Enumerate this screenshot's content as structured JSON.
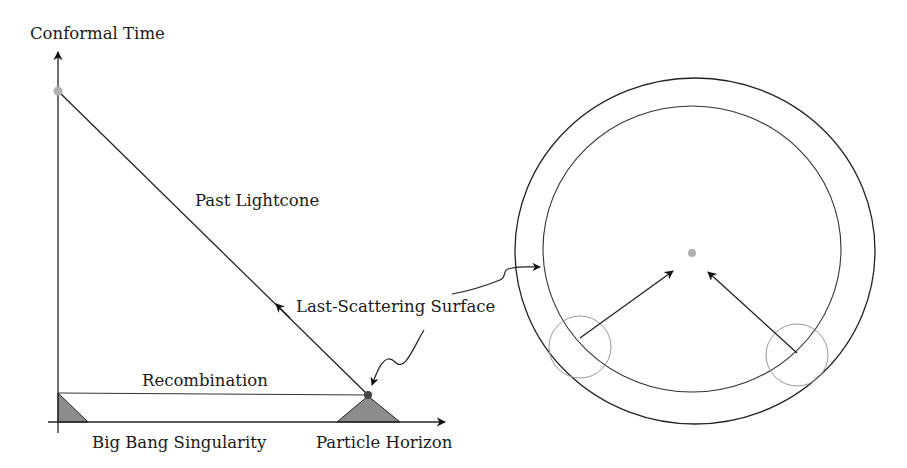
{
  "diagram": {
    "axes": {
      "y_label": "Conformal Time",
      "x_label_left": "Big Bang Singularity",
      "x_label_right": "Particle Horizon"
    },
    "labels": {
      "past_lightcone": "Past Lightcone",
      "recombination": "Recombination",
      "last_scattering_surface": "Last-Scattering Surface"
    },
    "colors": {
      "line": "#222222",
      "shaded_region": "#8c8c8c",
      "observer_dot": "#b0b0b0",
      "thin_circle": "#999999",
      "dot_dark": "#444444"
    }
  }
}
